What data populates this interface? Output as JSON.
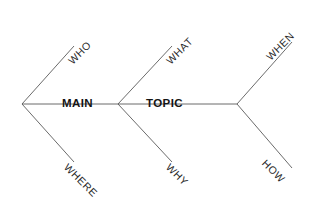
{
  "canvas": {
    "width": 320,
    "height": 212,
    "background": "#ffffff"
  },
  "diagram": {
    "type": "fishbone",
    "title_parts": [
      "MAIN",
      "TOPIC"
    ],
    "line_color": "#5a5a5a",
    "text_color": "#141414",
    "branch_text_color": "#2b2b2b"
  },
  "spine": {
    "label_main": "MAIN",
    "label_topic": "TOPIC",
    "start_x": 22,
    "end_x": 237,
    "y": 104
  },
  "branches": {
    "upper": [
      {
        "label": "WHO",
        "x": 74,
        "y": 56
      },
      {
        "label": "WHAT",
        "x": 172,
        "y": 56
      },
      {
        "label": "WHEN",
        "x": 272,
        "y": 52
      }
    ],
    "lower": [
      {
        "label": "WHERE",
        "x": 70,
        "y": 164
      },
      {
        "label": "WHY",
        "x": 172,
        "y": 164
      },
      {
        "label": "HOW",
        "x": 268,
        "y": 160
      }
    ]
  }
}
